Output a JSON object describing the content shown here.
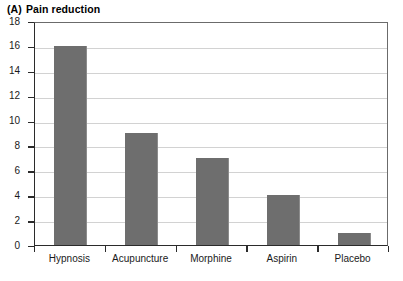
{
  "chart_data": {
    "type": "bar",
    "panel_tag": "(A)",
    "title_text": "Pain reduction",
    "categories": [
      "Hypnosis",
      "Acupuncture",
      "Morphine",
      "Aspirin",
      "Placebo"
    ],
    "values": [
      16,
      9,
      7,
      4,
      1
    ],
    "xlabel": "",
    "ylabel": "",
    "ylim": [
      0,
      18
    ],
    "yticks": [
      0,
      2,
      4,
      6,
      8,
      10,
      12,
      14,
      16,
      18
    ],
    "ytick_labels": [
      "0",
      "2",
      "4",
      "6",
      "8",
      "10",
      "12",
      "14",
      "16",
      "18"
    ],
    "grid": "horizontal",
    "legend": "none",
    "bar_color": "#6e6e6e",
    "gridline_color": "#d2d2d2",
    "axis_color": "#2b2b2b",
    "background_color": "#ffffff"
  }
}
